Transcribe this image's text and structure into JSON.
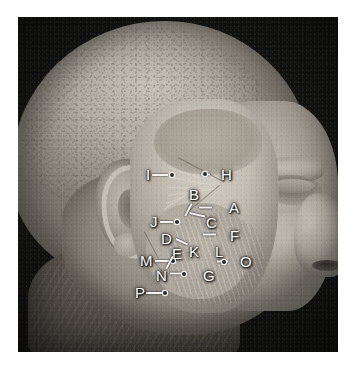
{
  "figure": {
    "type": "anatomical-photograph",
    "background_color": "#ffffff",
    "plate_background_color": "#060606",
    "label_color": "#ffffff",
    "leader_color": "#f2f2f2",
    "marker_color": "#2b2b2b",
    "plate": {
      "x": 18,
      "y": 17,
      "width": 320,
      "height": 335
    }
  },
  "labels": [
    {
      "id": "A",
      "text": "A",
      "x": 229,
      "y": 200,
      "leader": {
        "x": 212,
        "y": 207,
        "length": 13,
        "angle": 180
      },
      "point": null
    },
    {
      "id": "B",
      "text": "B",
      "x": 189,
      "y": 187,
      "leader": {
        "x": 192,
        "y": 203,
        "length": 14,
        "angle": 118
      },
      "point": null
    },
    {
      "id": "C",
      "text": "C",
      "x": 206,
      "y": 215,
      "leader": {
        "x": 205,
        "y": 216,
        "length": 16,
        "angle": 193
      },
      "point": null
    },
    {
      "id": "D",
      "text": "D",
      "x": 161,
      "y": 231,
      "leader": {
        "x": 176,
        "y": 238,
        "length": 13,
        "angle": 25
      },
      "point": null
    },
    {
      "id": "E",
      "text": "E",
      "x": 172,
      "y": 246,
      "leader": null,
      "point": null
    },
    {
      "id": "F",
      "text": "F",
      "x": 230,
      "y": 228,
      "leader": {
        "x": 216,
        "y": 234,
        "length": 13,
        "angle": 180
      },
      "point": null
    },
    {
      "id": "G",
      "text": "G",
      "x": 203,
      "y": 268,
      "leader": {
        "x": 186,
        "y": 273,
        "length": 16,
        "angle": 180
      },
      "point": {
        "x": 182,
        "y": 272
      }
    },
    {
      "id": "H",
      "text": "H",
      "x": 221,
      "y": 167,
      "leader": {
        "x": 210,
        "y": 174,
        "length": 9,
        "angle": 180
      },
      "point": {
        "x": 203,
        "y": 172
      }
    },
    {
      "id": "I",
      "text": "I",
      "x": 146,
      "y": 167,
      "leader": {
        "x": 152,
        "y": 174,
        "length": 16,
        "angle": 0
      },
      "point": {
        "x": 170,
        "y": 173
      }
    },
    {
      "id": "J",
      "text": "J",
      "x": 150,
      "y": 214,
      "leader": {
        "x": 160,
        "y": 221,
        "length": 13,
        "angle": 0
      },
      "point": {
        "x": 175,
        "y": 220
      }
    },
    {
      "id": "K",
      "text": "K",
      "x": 189,
      "y": 244,
      "leader": null,
      "point": null
    },
    {
      "id": "L",
      "text": "L",
      "x": 215,
      "y": 244,
      "leader": null,
      "point": null
    },
    {
      "id": "M",
      "text": "M",
      "x": 140,
      "y": 253,
      "leader": {
        "x": 155,
        "y": 260,
        "length": 14,
        "angle": 0
      },
      "point": {
        "x": 171,
        "y": 259
      }
    },
    {
      "id": "N",
      "text": "N",
      "x": 156,
      "y": 268,
      "leader": {
        "x": 166,
        "y": 268,
        "length": 14,
        "angle": -62
      },
      "point": null
    },
    {
      "id": "O",
      "text": "O",
      "x": 240,
      "y": 254,
      "leader": {
        "x": 228,
        "y": 261,
        "length": 11,
        "angle": 180
      },
      "point": {
        "x": 222,
        "y": 260
      }
    },
    {
      "id": "P",
      "text": "P",
      "x": 135,
      "y": 285,
      "leader": {
        "x": 146,
        "y": 292,
        "length": 16,
        "angle": 0
      },
      "point": {
        "x": 163,
        "y": 291
      }
    }
  ]
}
